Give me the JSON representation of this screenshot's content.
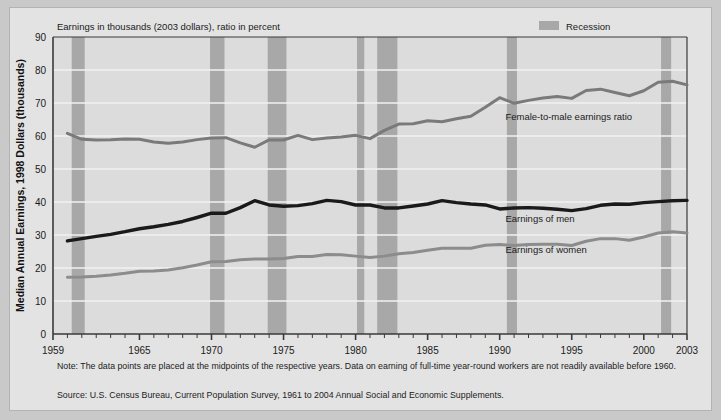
{
  "figure": {
    "chart_title": "Earnings in thousands (2003 dollars), ratio in percent",
    "y_axis_title": "Median Annual Earnings, 1998 Dollars (thousands)",
    "legend": {
      "recession_label": "Recession",
      "recession_swatch_color": "#a8a8a8"
    },
    "series_labels": {
      "ratio": "Female-to-male earnings ratio",
      "men": "Earnings of men",
      "women": "Earnings of women"
    },
    "notes": {
      "note": "Note: The data points are placed at the midpoints of the respective years. Data on earning of full-time year-round workers are not readily available before 1960.",
      "source": "Source: U.S. Census Bureau, Current Population Survey, 1961 to 2004 Annual Social and Economic Supplements."
    },
    "colors": {
      "page_background": "#c9c9c9",
      "figure_background": "#e3e3e3",
      "plot_background": "#dcdcdc",
      "gridline": "#f2f2f2",
      "axis": "#3a3a3a",
      "men_line": "#1a1a1a",
      "women_line": "#8c8c8c",
      "ratio_line": "#7a7a7a",
      "recession_band": "#a8a8a8"
    }
  },
  "chart_data": {
    "type": "line",
    "title": "Earnings in thousands (2003 dollars), ratio in percent",
    "xlabel": "",
    "ylabel": "Median Annual Earnings, 1998 Dollars (thousands)",
    "ylim": [
      0,
      90
    ],
    "xlim": [
      1959,
      2003
    ],
    "ytick_labels": [
      "0",
      "10",
      "20",
      "30",
      "40",
      "50",
      "60",
      "70",
      "80",
      "90"
    ],
    "yticks": [
      0,
      10,
      20,
      30,
      40,
      50,
      60,
      70,
      80,
      90
    ],
    "xtick_labels": [
      "1959",
      "1965",
      "1970",
      "1975",
      "1980",
      "1985",
      "1990",
      "1995",
      "2000",
      "2003"
    ],
    "xticks": [
      1959,
      1965,
      1970,
      1975,
      1980,
      1985,
      1990,
      1995,
      2000,
      2003
    ],
    "grid": "horizontal",
    "legend_position": "top-right",
    "x": [
      1960,
      1961,
      1962,
      1963,
      1964,
      1965,
      1966,
      1967,
      1968,
      1969,
      1970,
      1971,
      1972,
      1973,
      1974,
      1975,
      1976,
      1977,
      1978,
      1979,
      1980,
      1981,
      1982,
      1983,
      1984,
      1985,
      1986,
      1987,
      1988,
      1989,
      1990,
      1991,
      1992,
      1993,
      1994,
      1995,
      1996,
      1997,
      1998,
      1999,
      2000,
      2001,
      2002,
      2003
    ],
    "series": [
      {
        "name": "Female-to-male earnings ratio",
        "color": "#7a7a7a",
        "unit": "percent",
        "values": [
          60.8,
          59.0,
          58.8,
          58.9,
          59.1,
          59.0,
          58.2,
          57.8,
          58.2,
          58.9,
          59.4,
          59.5,
          57.9,
          56.6,
          58.8,
          58.8,
          60.2,
          58.9,
          59.4,
          59.7,
          60.2,
          59.2,
          61.7,
          63.6,
          63.7,
          64.6,
          64.3,
          65.2,
          66.0,
          68.7,
          71.6,
          69.9,
          70.8,
          71.5,
          72.0,
          71.4,
          73.8,
          74.2,
          73.2,
          72.2,
          73.7,
          76.3,
          76.6,
          75.5
        ]
      },
      {
        "name": "Earnings of men",
        "color": "#1a1a1a",
        "unit": "thousands of 2003 dollars",
        "values": [
          28.2,
          28.9,
          29.6,
          30.2,
          31.0,
          31.9,
          32.5,
          33.2,
          34.1,
          35.3,
          36.6,
          36.6,
          38.3,
          40.4,
          39.1,
          38.7,
          38.9,
          39.5,
          40.5,
          40.1,
          39.1,
          39.1,
          38.2,
          38.2,
          38.8,
          39.4,
          40.4,
          39.8,
          39.4,
          39.1,
          37.9,
          38.2,
          38.3,
          38.1,
          37.8,
          37.4,
          38.0,
          39.0,
          39.4,
          39.3,
          39.8,
          40.1,
          40.4,
          40.5
        ]
      },
      {
        "name": "Earnings of women",
        "color": "#8c8c8c",
        "unit": "thousands of 2003 dollars",
        "values": [
          17.2,
          17.3,
          17.5,
          17.9,
          18.4,
          19.0,
          19.1,
          19.4,
          20.1,
          20.9,
          21.9,
          22.0,
          22.5,
          22.7,
          22.7,
          22.9,
          23.5,
          23.5,
          24.1,
          24.0,
          23.6,
          23.2,
          23.6,
          24.3,
          24.7,
          25.4,
          26.0,
          26.0,
          26.0,
          26.9,
          27.1,
          26.8,
          27.1,
          27.2,
          27.2,
          26.8,
          28.1,
          28.9,
          28.9,
          28.4,
          29.4,
          30.6,
          31.0,
          30.6
        ]
      }
    ],
    "recessions": [
      {
        "start": 1960.3,
        "end": 1961.2
      },
      {
        "start": 1969.9,
        "end": 1970.9
      },
      {
        "start": 1973.9,
        "end": 1975.2
      },
      {
        "start": 1980.1,
        "end": 1980.6
      },
      {
        "start": 1981.5,
        "end": 1982.9
      },
      {
        "start": 1990.5,
        "end": 1991.2
      },
      {
        "start": 2001.2,
        "end": 2001.9
      }
    ]
  }
}
